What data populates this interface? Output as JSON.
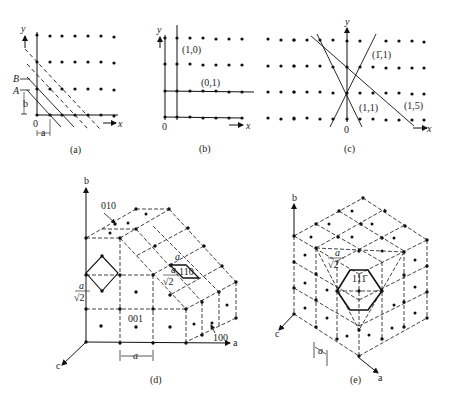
{
  "figure": {
    "panels": [
      {
        "id": "a",
        "caption": "(a)",
        "axis_x": "x",
        "axis_y": "y",
        "origin": "0",
        "labels": {
          "B": "B",
          "A": "A",
          "b": "b",
          "a": "a"
        }
      },
      {
        "id": "b",
        "caption": "(b)",
        "axis_x": "x",
        "axis_y": "y",
        "origin": "0",
        "line_labels": [
          "(1,0)",
          "(0,1)"
        ]
      },
      {
        "id": "c",
        "caption": "(c)",
        "axis_x": "x",
        "axis_y": "y",
        "origin": "0",
        "line_labels": [
          "(1̄,1)",
          "(1,1)",
          "(1,5)"
        ]
      },
      {
        "id": "d",
        "caption": "(d)",
        "axes": {
          "a": "a",
          "b": "b",
          "c": "c"
        },
        "plane_labels": [
          "010",
          "110",
          "001",
          "100"
        ],
        "dims": {
          "a": "a",
          "a_over_root2_num": "a",
          "a_over_root2_den": "√2"
        }
      },
      {
        "id": "e",
        "caption": "(e)",
        "axes": {
          "a": "a",
          "b": "b",
          "c": "c"
        },
        "plane_label": "111̄",
        "dims": {
          "a": "a",
          "a_over_root2_num": "a",
          "a_over_root2_den": "√2"
        }
      }
    ]
  }
}
